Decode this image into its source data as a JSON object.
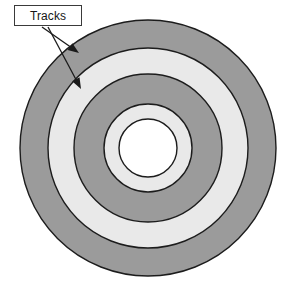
{
  "figure": {
    "title": "Tracks",
    "kind": "concentric-disk-tracks-diagram",
    "background_color": "#ffffff"
  },
  "callout": {
    "label": "Tracks",
    "box": {
      "x": 14,
      "y": 5,
      "width": 68,
      "height": 21,
      "fill": "#ffffff",
      "stroke": "#3a3a3a"
    },
    "arrows": [
      {
        "name": "arrow-to-outer-track",
        "from_x": 42,
        "from_y": 27,
        "to_x": 79,
        "to_y": 53,
        "color": "#1a1a1a"
      },
      {
        "name": "arrow-to-inner-track",
        "from_x": 48,
        "from_y": 27,
        "to_x": 81,
        "to_y": 89,
        "color": "#1a1a1a"
      }
    ]
  },
  "disk": {
    "center_x": 148,
    "center_y": 148,
    "stroke_color": "#1c1c1c",
    "stroke_width": 1.4,
    "colors": {
      "dark_gray": "#9b9b9b",
      "light_gray": "#e9e9e9",
      "white": "#ffffff"
    },
    "rings": [
      {
        "name": "outer-track-dark",
        "radius": 128,
        "fill": "#9b9b9b"
      },
      {
        "name": "track-light-1",
        "radius": 100,
        "fill": "#e9e9e9"
      },
      {
        "name": "track-dark-2",
        "radius": 74,
        "fill": "#9b9b9b"
      },
      {
        "name": "track-light-2",
        "radius": 44,
        "fill": "#e9e9e9"
      },
      {
        "name": "spindle-hole",
        "radius": 29,
        "fill": "#ffffff"
      }
    ]
  }
}
